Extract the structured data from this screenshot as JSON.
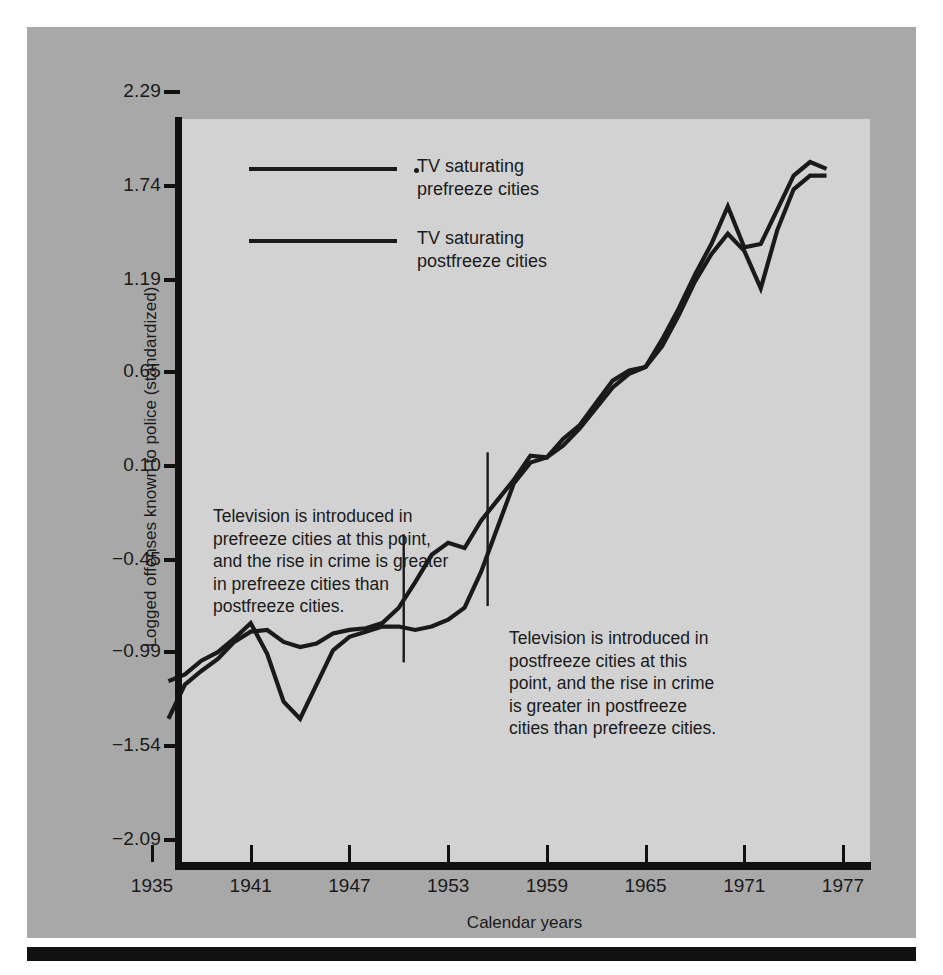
{
  "chart_data": {
    "type": "line",
    "title": "",
    "xlabel": "Calendar years",
    "ylabel": "Logged offenses known to police (standardized)",
    "xlim": [
      1935,
      1977
    ],
    "ylim": [
      -2.09,
      2.29
    ],
    "grid": false,
    "legend_position": "upper-left-inside",
    "xticks": [
      "1935",
      "1941",
      "1947",
      "1953",
      "1959",
      "1965",
      "1971",
      "1977"
    ],
    "ytick_values": [
      2.29,
      1.74,
      1.19,
      0.65,
      0.1,
      -0.45,
      -0.99,
      -1.54,
      -2.09
    ],
    "yticks": [
      "2.29",
      "1.74",
      "1.19",
      "0.65",
      "0.10",
      "−0.45",
      "−0.99",
      "−1.54",
      "−2.09"
    ],
    "series": [
      {
        "name": "TV saturating prefreeze cities",
        "color": "#1a1a1a",
        "x": [
          1936,
          1937,
          1938,
          1939,
          1940,
          1941,
          1942,
          1943,
          1944,
          1945,
          1946,
          1947,
          1948,
          1949,
          1950,
          1951,
          1952,
          1953,
          1954,
          1955,
          1956,
          1957,
          1958,
          1959,
          1960,
          1961,
          1962,
          1963,
          1964,
          1965,
          1966,
          1967,
          1968,
          1969,
          1970,
          1971,
          1972,
          1973,
          1974,
          1975,
          1976
        ],
        "y": [
          -1.38,
          -1.18,
          -1.1,
          -1.03,
          -0.93,
          -0.87,
          -0.86,
          -0.93,
          -0.96,
          -0.94,
          -0.88,
          -0.86,
          -0.85,
          -0.82,
          -0.73,
          -0.58,
          -0.42,
          -0.35,
          -0.38,
          -0.22,
          -0.1,
          0.02,
          0.16,
          0.15,
          0.26,
          0.34,
          0.47,
          0.6,
          0.66,
          0.68,
          0.84,
          1.02,
          1.22,
          1.4,
          1.62,
          1.38,
          1.4,
          1.6,
          1.8,
          1.88,
          1.84
        ]
      },
      {
        "name": "TV saturating postfreeze cities",
        "color": "#1a1a1a",
        "x": [
          1936,
          1937,
          1938,
          1939,
          1940,
          1941,
          1942,
          1943,
          1944,
          1945,
          1946,
          1947,
          1948,
          1949,
          1950,
          1951,
          1952,
          1953,
          1954,
          1955,
          1956,
          1957,
          1958,
          1959,
          1960,
          1961,
          1962,
          1963,
          1964,
          1965,
          1966,
          1967,
          1968,
          1969,
          1970,
          1971,
          1972,
          1973,
          1974,
          1975,
          1976
        ],
        "y": [
          -1.16,
          -1.12,
          -1.04,
          -0.99,
          -0.91,
          -0.82,
          -1.0,
          -1.28,
          -1.38,
          -1.18,
          -0.98,
          -0.9,
          -0.87,
          -0.84,
          -0.84,
          -0.86,
          -0.84,
          -0.8,
          -0.73,
          -0.52,
          -0.26,
          0.0,
          0.12,
          0.15,
          0.22,
          0.32,
          0.44,
          0.56,
          0.64,
          0.68,
          0.8,
          0.98,
          1.18,
          1.34,
          1.46,
          1.36,
          1.14,
          1.48,
          1.72,
          1.8,
          1.8
        ]
      }
    ],
    "markers": [
      {
        "name": "tv-introduced-prefreeze",
        "x": 1950.3,
        "y_top": -0.3,
        "y_bottom": -1.05
      },
      {
        "name": "tv-introduced-postfreeze",
        "x": 1955.4,
        "y_top": 0.18,
        "y_bottom": -0.72
      }
    ]
  },
  "legend": {
    "items": [
      {
        "label": "TV saturating\nprefreeze cities"
      },
      {
        "label": "TV saturating\npostfreeze cities"
      }
    ]
  },
  "annotations": {
    "prefreeze": "Television is introduced in\nprefreeze cities at this point,\nand the rise in crime is greater\nin prefreeze cities than\npostfreeze cities.",
    "postfreeze": "Television is introduced in\npostfreeze cities at this\npoint, and the rise in crime\nis greater in postfreeze\ncities than prefreeze cities."
  },
  "axes": {
    "x_title": "Calendar years",
    "y_title": "Logged offenses known to police (standardized)"
  },
  "colors": {
    "panel_background": "#a8a8a8",
    "plot_background": "#d2d2d2",
    "line": "#1a1a1a",
    "axis": "#111111",
    "page_background": "#ffffff"
  }
}
